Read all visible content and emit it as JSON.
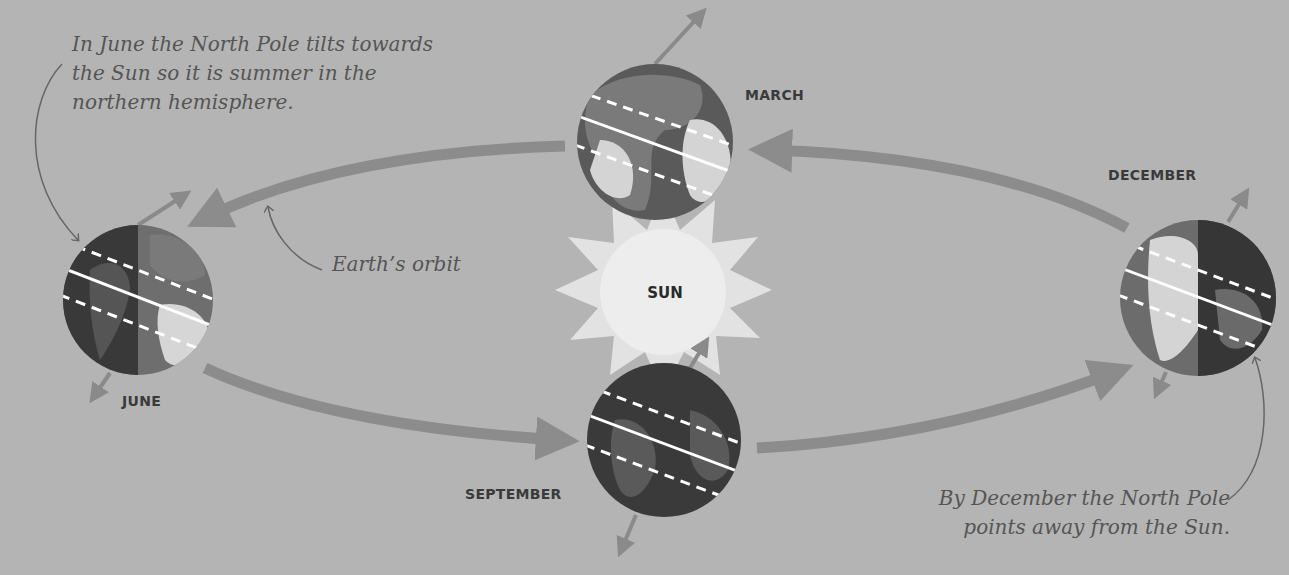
{
  "diagram": {
    "colors": {
      "background": "#b4b4b4",
      "orbit_arrow": "#8c8c8c",
      "sun_core": "#ececec",
      "sun_rays": "#e0e0e0",
      "globe_ocean_dark": "#3c3c3c",
      "globe_ocean_lit": "#6c6c6c",
      "globe_land_dark": "#555555",
      "globe_land_lit": "#d6d6d6",
      "latitude_lines": "#ffffff",
      "text": "#3a3a3a",
      "annotation_text": "#555555"
    },
    "sun": {
      "label": "SUN"
    },
    "positions": [
      {
        "id": "march",
        "label": "MARCH",
        "phase": "equinox"
      },
      {
        "id": "june",
        "label": "JUNE",
        "phase": "north pole tilted toward Sun"
      },
      {
        "id": "september",
        "label": "SEPTEMBER",
        "phase": "equinox"
      },
      {
        "id": "december",
        "label": "DECEMBER",
        "phase": "north pole tilted away from Sun"
      }
    ],
    "annotations": {
      "june_note": [
        "In June the North Pole tilts towards",
        "the Sun so it is summer in the",
        "northern hemisphere."
      ],
      "orbit_note": "Earth’s orbit",
      "december_note": [
        "By December the North Pole",
        "points away from the Sun."
      ]
    }
  }
}
